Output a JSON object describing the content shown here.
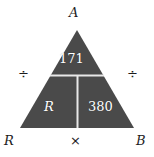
{
  "diagram": {
    "type": "formula-triangle",
    "shape": {
      "fill_color": "#4a4a4a",
      "divider_color": "#e8e8e8",
      "background_color": "#ffffff",
      "apex": [
        77,
        30
      ],
      "base_left": [
        20,
        128
      ],
      "base_right": [
        134,
        128
      ],
      "horizontal_divider_y": 75,
      "vertical_divider_x": 77
    },
    "vertices": [
      {
        "id": "apex",
        "label": "A"
      },
      {
        "id": "bottom-left",
        "label": "R"
      },
      {
        "id": "bottom-right",
        "label": "B"
      }
    ],
    "operators": [
      {
        "id": "left",
        "symbol": "÷"
      },
      {
        "id": "right",
        "symbol": "÷"
      },
      {
        "id": "bottom",
        "symbol": "×"
      }
    ],
    "cells": [
      {
        "id": "top",
        "value": "171",
        "style": "upright"
      },
      {
        "id": "bottom-left",
        "value": "R",
        "style": "italic"
      },
      {
        "id": "bottom-right",
        "value": "380",
        "style": "upright"
      }
    ]
  }
}
